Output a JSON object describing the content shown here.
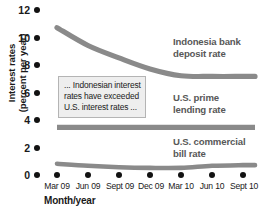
{
  "chart_data": {
    "type": "line",
    "title": "",
    "xlabel": "Month/year",
    "ylabel": "Interest rates (percent per year)",
    "ylabel_line1": "Interest rates",
    "ylabel_line2": "(percent per year)",
    "categories": [
      "Mar 09",
      "Jun 09",
      "Sept 09",
      "Dec 09",
      "Mar 10",
      "Jun 10",
      "Sept 10"
    ],
    "ylim": [
      0,
      12
    ],
    "yticks": [
      0,
      2,
      4,
      6,
      8,
      10,
      12
    ],
    "ytick_labels": [
      "0",
      "2",
      "4",
      "6",
      "8",
      "10",
      "12"
    ],
    "grid": false,
    "legend": "inline-right",
    "series": [
      {
        "name": "Indonesia bank deposit rate",
        "label_line1": "Indonesia bank",
        "label_line2": "deposit rate",
        "values": [
          10.5,
          9.2,
          8.3,
          7.5,
          7.0,
          6.95,
          6.95
        ],
        "color": "#8a8a8a"
      },
      {
        "name": "U.S. prime lending rate",
        "label_line1": "U.S. prime",
        "label_line2": "lending rate",
        "values": [
          3.25,
          3.25,
          3.25,
          3.25,
          3.25,
          3.25,
          3.25
        ],
        "color": "#8a8a8a"
      },
      {
        "name": "U.S. commercial bill rate",
        "label_line1": "U.S. commercial",
        "label_line2": "bill rate",
        "values": [
          0.6,
          0.45,
          0.35,
          0.3,
          0.3,
          0.45,
          0.5
        ],
        "color": "#8a8a8a"
      }
    ],
    "annotations": [
      {
        "name": "callout",
        "line1": "... Indonesian interest",
        "line2": "rates have exceeded",
        "line3": "U.S. interest rates ..."
      }
    ]
  }
}
